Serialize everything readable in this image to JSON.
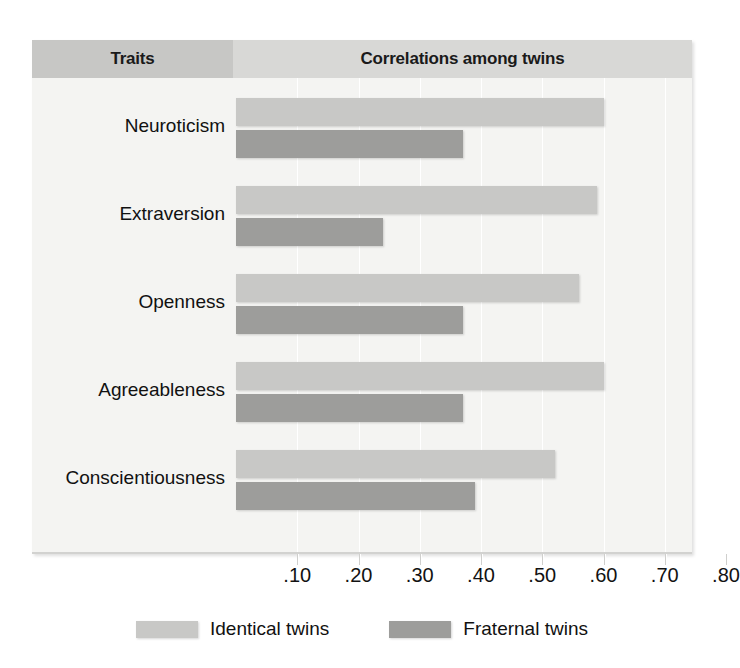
{
  "header": {
    "traits_label": "Traits",
    "correlations_label": "Correlations among twins"
  },
  "legend": {
    "items": [
      {
        "label": "Identical twins",
        "color": "#c8c8c6",
        "swatch_icon": "legend-swatch-icon"
      },
      {
        "label": "Fraternal twins",
        "color": "#9d9d9b",
        "swatch_icon": "legend-swatch-icon"
      }
    ]
  },
  "axis": {
    "tick_labels": [
      ".10",
      ".20",
      ".30",
      ".40",
      ".50",
      ".60",
      ".70",
      ".80"
    ]
  },
  "colors": {
    "panel_background": "#f2f2f0",
    "plot_background": "#f4f4f2",
    "header_traits": "#c7c7c5",
    "header_correlations": "#d8d8d6",
    "identical_bar": "#c8c8c6",
    "fraternal_bar": "#9d9d9b",
    "gridline": "#ffffff",
    "text": "#111111"
  },
  "chart_data": {
    "type": "bar",
    "orientation": "horizontal",
    "title": "Correlations among twins",
    "xlabel": "Correlations among twins",
    "ylabel": "Traits",
    "xlim": [
      0,
      0.85
    ],
    "xticks": [
      0.1,
      0.2,
      0.3,
      0.4,
      0.5,
      0.6,
      0.7,
      0.8
    ],
    "xticklabels": [
      ".10",
      ".20",
      ".30",
      ".40",
      ".50",
      ".60",
      ".70",
      ".80"
    ],
    "grid": true,
    "legend_position": "bottom",
    "categories": [
      "Neuroticism",
      "Extraversion",
      "Openness",
      "Agreeableness",
      "Conscientiousness"
    ],
    "series": [
      {
        "name": "Identical twins",
        "color": "#c8c8c6",
        "values": [
          0.6,
          0.59,
          0.56,
          0.6,
          0.52
        ]
      },
      {
        "name": "Fraternal twins",
        "color": "#9d9d9b",
        "values": [
          0.37,
          0.24,
          0.37,
          0.37,
          0.39
        ]
      }
    ]
  }
}
